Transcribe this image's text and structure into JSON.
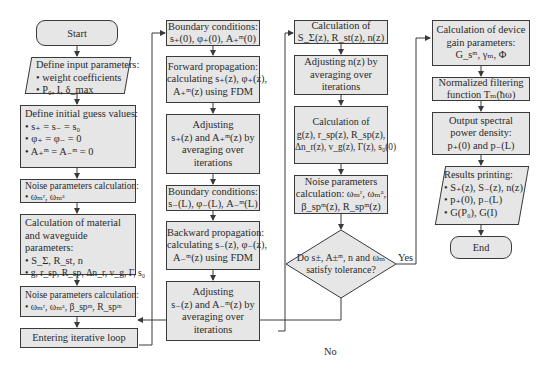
{
  "colors": {
    "box_fill": "#e6e6e6",
    "border": "#3a3a3a",
    "text": "#2a2a2a",
    "background": "#ffffff"
  },
  "column1": {
    "start": "Start",
    "input_params": {
      "title": "Define input parameters:",
      "items": [
        "• weight coefficients",
        "• P₀, I, δ_max"
      ]
    },
    "initial_guess": {
      "title": "Define initial guess values:",
      "items": [
        "• s₊ = s₋ = s₀",
        "• φ₊ = φ₋ = 0",
        "• A₊ᵐ = A₋ᵐ = 0"
      ]
    },
    "noise1": {
      "title": "Noise parameters calculation:",
      "items": [
        "• ωₘʳ, ωₘᵃ"
      ]
    },
    "material": {
      "title": "Calculation of material and waveguide parameters:",
      "items": [
        "• S_Σ, R_st, n",
        "• g, r_sp, R_sp, Δn_r, v_g, Γ, s₀"
      ]
    },
    "noise2": {
      "title": "Noise parameters calculation:",
      "items": [
        "• ωₘʳ, ωₘᵃ, β_spᵐ, R_spᵐ"
      ]
    },
    "loop": "Entering iterative loop"
  },
  "column2": {
    "bc_forward": [
      "Boundary conditions:",
      "s₊(0), φ₊(0), A₊ᵐ(0)"
    ],
    "forward": [
      "Forward propagation:",
      "calculating s₊(z), φ₊(z),",
      "A₊ᵐ(z) using FDM"
    ],
    "adjust_forward": [
      "Adjusting",
      "s₊(z) and A₊ᵐ(z) by",
      "averaging over",
      "iterations"
    ],
    "bc_backward": [
      "Boundary conditions:",
      "s₋(L), φ₋(L), A₋ᵐ(L)"
    ],
    "backward": [
      "Backward propagation:",
      "calculating s₋(z), φ₋(z),",
      "A₋ᵐ(z) using FDM"
    ],
    "adjust_backward": [
      "Adjusting",
      "s₋(z) and A₋ᵐ(z) by",
      "averaging over",
      "iterations"
    ]
  },
  "column3": {
    "calc_s": [
      "Calculation of",
      "S_Σ(z), R_st(z), n(z)"
    ],
    "adjust_n": [
      "Adjusting n(z) by",
      "averaging over",
      "iterations"
    ],
    "calc_g": [
      "Calculation of",
      "g(z), r_sp(z), R_sp(z),",
      "Δn_r(z), v_g(z), Γ(z), s₀(0)"
    ],
    "noise3": [
      "Noise parameters",
      "calculation: ωₘʳ, ωₘᵃ,",
      "β_spᵐ(z), R_spᵐ(z)"
    ],
    "decision": [
      "Do s±, A±ᵐ, n and ωₘ",
      "satisfy tolerance?"
    ],
    "yes_label": "Yes",
    "no_label": "No"
  },
  "column4": {
    "gain": [
      "Calculation of device",
      "gain parameters:",
      "G_sᵐ, γₘ, Φ"
    ],
    "filter": [
      "Normalized filtering",
      "function Tₘ(ħω)"
    ],
    "spectral": [
      "Output spectral",
      "power density:",
      "p₊(0) and p₋(L)"
    ],
    "results": {
      "title": "Results printing:",
      "items": [
        "• S₊(z), S₋(z), n(z)",
        "• p₊(0), p₋(L)",
        "• G(P₀), G(I)"
      ]
    },
    "end": "End"
  }
}
